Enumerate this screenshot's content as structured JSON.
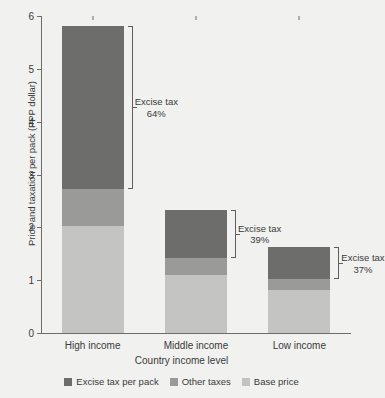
{
  "chart_data": {
    "type": "bar",
    "stacked": true,
    "title": "",
    "xlabel": "Country income level",
    "ylabel": "Price and taxation per pack (PPP dollar)",
    "categories": [
      "High income",
      "Middle income",
      "Low income"
    ],
    "ylim": [
      0,
      6
    ],
    "yticks": [
      0,
      1,
      2,
      3,
      4,
      5,
      6
    ],
    "ytick_labels": [
      "0",
      "1",
      "2",
      "3",
      "4",
      "5",
      "6"
    ],
    "grid": false,
    "legend_position": "bottom",
    "series": [
      {
        "name": "Base price",
        "color": "#c4c4c2",
        "values": [
          2.02,
          1.1,
          0.82
        ]
      },
      {
        "name": "Other taxes",
        "color": "#9a9a98",
        "values": [
          0.71,
          0.32,
          0.2
        ]
      },
      {
        "name": "Excise tax per pack",
        "color": "#6d6d6b",
        "values": [
          3.09,
          0.91,
          0.6
        ]
      }
    ],
    "totals": [
      5.82,
      2.33,
      1.62
    ],
    "annotations": [
      {
        "category": "High income",
        "label": "Excise tax",
        "value": "64%",
        "range": [
          2.73,
          5.82
        ]
      },
      {
        "category": "Middle income",
        "label": "Excise tax",
        "value": "39%",
        "range": [
          1.42,
          2.33
        ]
      },
      {
        "category": "Low income",
        "label": "Excise tax",
        "value": "37%",
        "range": [
          1.02,
          1.62
        ]
      }
    ]
  },
  "legend": {
    "items": [
      {
        "label": "Excise tax per pack",
        "color": "#6d6d6b"
      },
      {
        "label": "Other taxes",
        "color": "#9a9a98"
      },
      {
        "label": "Base price",
        "color": "#c4c4c2"
      }
    ]
  }
}
